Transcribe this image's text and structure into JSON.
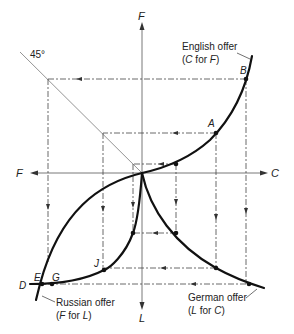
{
  "figure": {
    "type": "offer-curve construction diagram (three-country trade)",
    "axes": {
      "up": "F",
      "left": "F",
      "right": "C",
      "down": "L"
    },
    "diagonal_label": "45°",
    "curves": [
      {
        "id": "english",
        "line1": "English offer",
        "line2_pre": "(",
        "line2_a": "C",
        "line2_mid": " for ",
        "line2_b": "F",
        "line2_post": ")"
      },
      {
        "id": "german",
        "line1": "German offer",
        "line2_pre": "(",
        "line2_a": "L",
        "line2_mid": " for ",
        "line2_b": "C",
        "line2_post": ")"
      },
      {
        "id": "russian",
        "line1": "Russian offer",
        "line2_pre": "(",
        "line2_a": "F",
        "line2_mid": " for ",
        "line2_b": "L",
        "line2_post": ")"
      }
    ],
    "points": {
      "A": "A",
      "B": "B",
      "D": "D",
      "E": "E",
      "G": "G",
      "J": "J"
    }
  }
}
